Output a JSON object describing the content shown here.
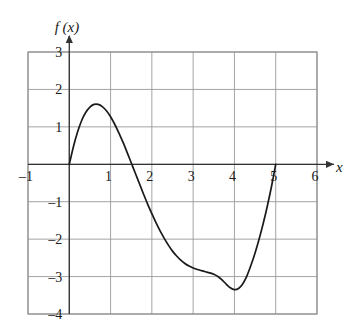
{
  "chart_data": {
    "type": "line",
    "title": "",
    "xlabel": "x",
    "ylabel": "f (x)",
    "xlim": [
      -1,
      6
    ],
    "ylim": [
      -4,
      3
    ],
    "grid": true,
    "legend": null,
    "x_ticks": [
      -1,
      1,
      2,
      3,
      4,
      5,
      6
    ],
    "x_tick_labels": [
      "–1",
      "1",
      "2",
      "3",
      "4",
      "5",
      "6"
    ],
    "y_ticks": [
      3,
      2,
      1,
      -1,
      -2,
      -3,
      -4
    ],
    "y_tick_labels": [
      "3",
      "2",
      "1",
      "–1",
      "–2",
      "–3",
      "–4"
    ],
    "series": [
      {
        "name": "f(x)",
        "color": "#1a1a1a",
        "x": [
          0.0,
          0.1,
          0.2,
          0.3,
          0.4,
          0.5,
          0.6,
          0.7,
          0.8,
          0.9,
          1.0,
          1.1,
          1.2,
          1.3,
          1.4,
          1.5,
          1.6,
          1.7,
          1.8,
          1.9,
          2.0,
          2.1,
          2.2,
          2.3,
          2.4,
          2.5,
          2.6,
          2.7,
          2.8,
          2.9,
          3.0,
          3.1,
          3.2,
          3.3,
          3.4,
          3.5,
          3.6,
          3.7,
          3.8,
          3.9,
          4.0,
          4.1,
          4.2,
          4.3,
          4.4,
          4.5,
          4.6,
          4.7,
          4.8,
          4.9,
          5.0
        ],
        "y": [
          0.0,
          0.47,
          0.86,
          1.17,
          1.39,
          1.53,
          1.6,
          1.6,
          1.54,
          1.43,
          1.27,
          1.07,
          0.84,
          0.59,
          0.32,
          0.04,
          -0.24,
          -0.52,
          -0.8,
          -1.07,
          -1.32,
          -1.56,
          -1.78,
          -1.98,
          -2.16,
          -2.32,
          -2.45,
          -2.56,
          -2.65,
          -2.72,
          -2.77,
          -2.81,
          -2.84,
          -2.87,
          -2.9,
          -2.94,
          -3.0,
          -3.09,
          -3.2,
          -3.3,
          -3.35,
          -3.32,
          -3.2,
          -2.99,
          -2.7,
          -2.37,
          -1.99,
          -1.57,
          -1.1,
          -0.58,
          0.0
        ],
        "annotations": {
          "roots": [
            0,
            2,
            5
          ],
          "local_max": {
            "x": 0.95,
            "y": 1.6
          },
          "local_min": {
            "x": 3.85,
            "y": -3.3
          }
        }
      }
    ],
    "axis_arrows": {
      "x": "right",
      "y": "up"
    },
    "colors": {
      "curve": "#1a1a1a",
      "axis": "#333333",
      "grid": "#9a9a9a",
      "frame": "#8c8c8c",
      "background": "#ffffff"
    }
  }
}
